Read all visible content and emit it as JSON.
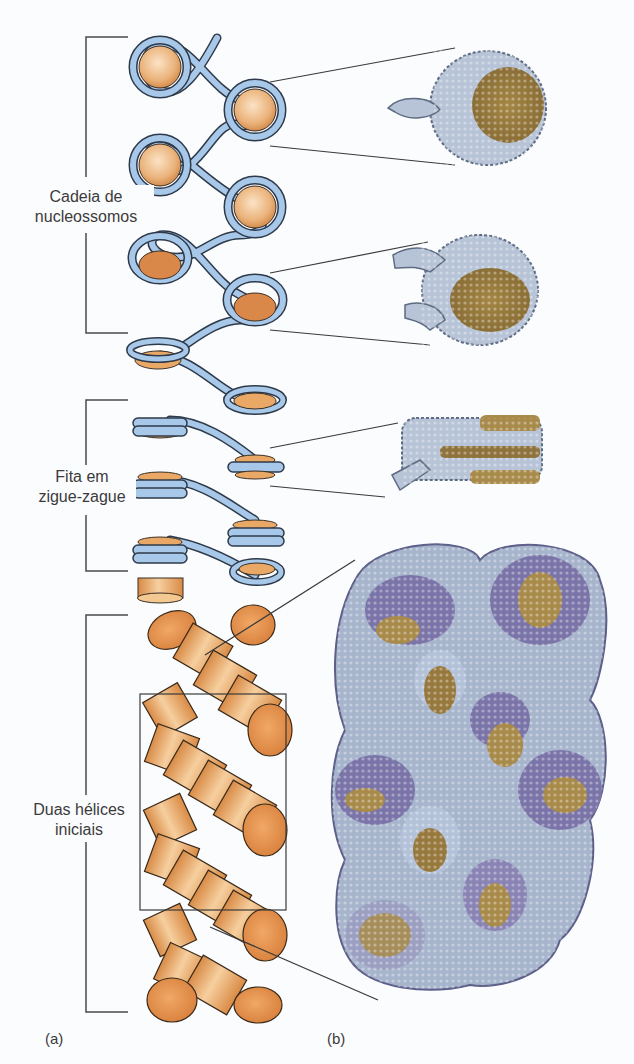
{
  "figure": {
    "panels": [
      {
        "id": "a",
        "label": "(a)"
      },
      {
        "id": "b",
        "label": "(b)"
      }
    ],
    "brackets": [
      {
        "label_line1": "Cadeia de",
        "label_line2": "nucleossomos"
      },
      {
        "label_line1": "Fita em",
        "label_line2": "zigue-zague"
      },
      {
        "label_line1": "Duas hélices",
        "label_line2": "iniciais"
      }
    ],
    "colors": {
      "dna_ribbon": "#a8c8ea",
      "dna_outline": "#2e3a4a",
      "histone_core": "#e9a866",
      "histone_dark": "#c9783a",
      "structure_dna_light": "#b7c3d6",
      "structure_dna_purple": "#7a74a8",
      "structure_protein": "#a88a4a",
      "leader_line": "#333333"
    }
  }
}
